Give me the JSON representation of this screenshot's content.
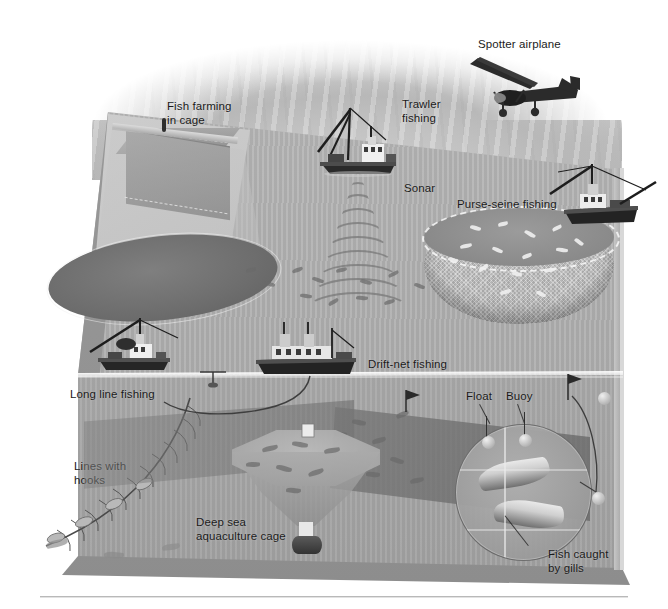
{
  "figure": {
    "kind": "cutaway-block-diagram",
    "palette": {
      "sky_light": "#e6e6e6",
      "sky_dark": "#b6b6b6",
      "sea_surface": "#b3b3b3",
      "sea_deep": "#a6a6a6",
      "net_gray": "#6d6d6d",
      "label_text": "#1b1b1b",
      "highlight_white": "#ffffff",
      "hull_dark": "#242424"
    }
  },
  "labels": {
    "spotter_airplane": "Spotter airplane",
    "trawler_fishing": "Trawler\nfishing",
    "fish_farming_in_cage": "Fish farming\nin cage",
    "sonar": "Sonar",
    "purse_seine_fishing": "Purse-seine fishing",
    "long_line_fishing": "Long line fishing",
    "lines_with_hooks": "Lines with\nhooks",
    "drift_net_fishing": "Drift-net fishing",
    "float": "Float",
    "buoy": "Buoy",
    "deep_sea_aquaculture_cage": "Deep sea\naquaculture cage",
    "fish_caught_by_gills": "Fish caught\nby gills"
  },
  "scene_elements": {
    "aircraft": [
      "spotter-airplane"
    ],
    "vessels": [
      "trawler",
      "purse-seine-vessel",
      "long-line-vessel",
      "drift-net-vessel"
    ],
    "gear": [
      "fish-farm-cage",
      "purse-seine-net",
      "long-line-with-hooks",
      "drift-net",
      "gill-net",
      "deep-sea-aquaculture-cage",
      "float",
      "buoy",
      "sonar-cone"
    ]
  }
}
